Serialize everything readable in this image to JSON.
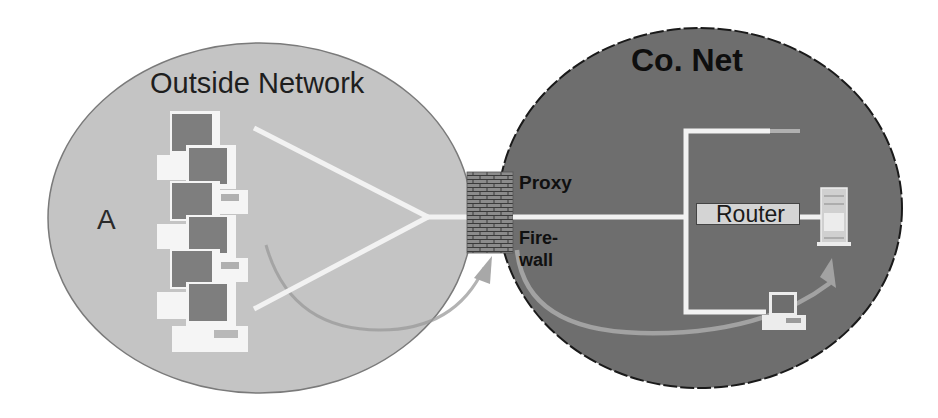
{
  "diagram": {
    "outside_network": {
      "title": "Outside Network",
      "node_label": "A",
      "fill": "#c4c4c4",
      "workstation_count": 6
    },
    "company_network": {
      "title": "Co. Net",
      "fill": "#6e6e6e"
    },
    "gateway": {
      "proxy_label": "Proxy",
      "firewall_label_line1": "Fire-",
      "firewall_label_line2": "wall"
    },
    "router": {
      "label": "Router"
    },
    "colors": {
      "link": "#f2f2f2",
      "arrow": "#9a9a9a",
      "firewall": "#8a8a8a",
      "text": "#111111"
    }
  }
}
